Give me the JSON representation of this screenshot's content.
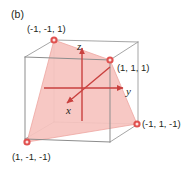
{
  "figure": {
    "panel_label": "(b)",
    "type": "3d-cube-plane-diagram",
    "axes": {
      "x_label": "x",
      "y_label": "y",
      "z_label": "z",
      "axis_color": "#c9413f",
      "origin_px": [
        82,
        88
      ]
    },
    "cube": {
      "edge_color": "#8d8d8d",
      "front_face_px": [
        [
          25,
          57
        ],
        [
          110,
          60
        ],
        [
          110,
          142
        ],
        [
          25,
          139
        ]
      ],
      "back_face_px": [
        [
          54,
          40
        ],
        [
          138,
          42
        ],
        [
          138,
          124
        ],
        [
          54,
          122
        ]
      ]
    },
    "plane": {
      "fill_color": "#f6c3bf",
      "edge_color": "#e8918c",
      "opacity": 0.85,
      "vertex_count": 4
    },
    "vertices": [
      {
        "name": "top-back-left",
        "label": "(-1, -1, 1)",
        "coords": [
          -1,
          -1,
          1
        ],
        "px": [
          54,
          40
        ],
        "marker_color": "#e0514f"
      },
      {
        "name": "top-front-right",
        "label": "(1, 1, 1)",
        "coords": [
          1,
          1,
          1
        ],
        "px": [
          110,
          60
        ],
        "marker_color": "#e0514f"
      },
      {
        "name": "bottom-back-right",
        "label": "(-1, 1, -1)",
        "coords": [
          -1,
          1,
          -1
        ],
        "px": [
          137,
          124
        ],
        "marker_color": "#e0514f"
      },
      {
        "name": "bottom-front-left",
        "label": "(1, -1, -1)",
        "coords": [
          1,
          -1,
          -1
        ],
        "px": [
          27,
          142
        ],
        "marker_color": "#e0514f"
      }
    ]
  }
}
